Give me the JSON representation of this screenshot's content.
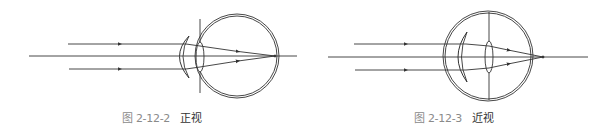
{
  "figures": [
    {
      "id": "normal",
      "caption_number": "图 2-12-2",
      "caption_title": "正视",
      "description": "Normal vision (emmetropia): parallel rays focus on the retina",
      "eye_center": [
        237,
        56
      ],
      "eye_radius": 41,
      "focus_point": [
        275,
        56
      ],
      "focus_on_retina": true
    },
    {
      "id": "myopia",
      "caption_number": "图 2-12-3",
      "caption_title": "近视",
      "description": "Myopia: parallel rays focus in front of the retina",
      "eye_center": [
        488,
        56
      ],
      "eye_radius": 44,
      "focus_point": [
        543,
        57
      ],
      "focus_on_retina": false
    }
  ],
  "colors": {
    "line": "#333333",
    "caption_number": "#8a8a8a",
    "caption_title": "#333333",
    "background": "#ffffff"
  }
}
